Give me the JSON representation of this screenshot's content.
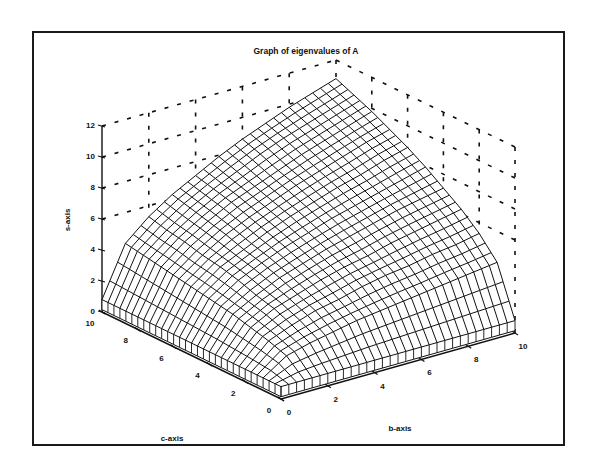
{
  "chart_data": {
    "type": "surface3d",
    "title": "Graph of eigenvalues of A",
    "xlabel": "b-axis",
    "ylabel": "c-axis",
    "zlabel": "s-axis",
    "xlim": [
      0,
      10
    ],
    "ylim": [
      0,
      10
    ],
    "zlim": [
      0,
      12
    ],
    "x_ticks": [
      "0",
      "2",
      "4",
      "6",
      "8",
      "10"
    ],
    "y_ticks": [
      "0",
      "2",
      "4",
      "6",
      "8",
      "10"
    ],
    "z_ticks": [
      "0",
      "2",
      "4",
      "6",
      "8",
      "10",
      "12"
    ],
    "grid": "dashed back walls",
    "mesh_lines": 31,
    "b": [
      0,
      1,
      2,
      3,
      4,
      5,
      6,
      7,
      8,
      9,
      10
    ],
    "c": [
      0,
      1,
      2,
      3,
      4,
      5,
      6,
      7,
      8,
      9,
      10
    ],
    "s_values_note": "rows indexed by c, columns by b",
    "s": [
      [
        0.8,
        0.8,
        0.8,
        0.8,
        0.8,
        0.8,
        0.8,
        0.8,
        0.8,
        0.8,
        0.8
      ],
      [
        0.8,
        1.8,
        2.2,
        2.5,
        2.8,
        3.0,
        3.2,
        3.4,
        3.6,
        3.8,
        4.0
      ],
      [
        0.8,
        2.2,
        2.8,
        3.3,
        3.6,
        4.0,
        4.3,
        4.5,
        4.8,
        5.0,
        5.3
      ],
      [
        0.8,
        2.5,
        3.3,
        3.8,
        4.3,
        4.7,
        5.0,
        5.4,
        5.7,
        6.0,
        6.3
      ],
      [
        0.8,
        2.8,
        3.6,
        4.3,
        4.8,
        5.3,
        5.7,
        6.1,
        6.5,
        6.8,
        7.1
      ],
      [
        0.8,
        3.0,
        4.0,
        4.7,
        5.3,
        5.8,
        6.3,
        6.7,
        7.1,
        7.5,
        7.9
      ],
      [
        0.8,
        3.2,
        4.3,
        5.0,
        5.7,
        6.3,
        6.8,
        7.3,
        7.7,
        8.2,
        8.6
      ],
      [
        0.8,
        3.4,
        4.5,
        5.4,
        6.1,
        6.7,
        7.3,
        7.8,
        8.3,
        8.8,
        9.2
      ],
      [
        0.8,
        3.6,
        4.8,
        5.7,
        6.5,
        7.1,
        7.7,
        8.3,
        8.8,
        9.3,
        9.8
      ],
      [
        0.8,
        3.8,
        5.0,
        6.0,
        6.8,
        7.5,
        8.2,
        8.8,
        9.3,
        9.8,
        10.3
      ],
      [
        0.8,
        4.0,
        5.3,
        6.3,
        7.1,
        7.9,
        8.6,
        9.2,
        9.8,
        10.3,
        10.8
      ]
    ]
  },
  "style": {
    "line_color": "#111111",
    "background": "#ffffff"
  }
}
